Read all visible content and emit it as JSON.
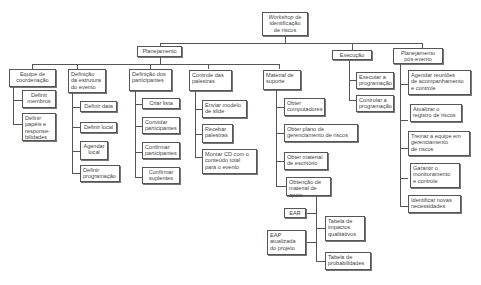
{
  "root": {
    "title_italic": "Workshop",
    "title_rest": " de\nidentificação\nde riscos"
  },
  "level1": [
    {
      "id": "planejamento",
      "label": "Planejamento"
    },
    {
      "id": "execucao",
      "label": "Execução"
    },
    {
      "id": "pos",
      "label": "Planejamento\npós-evento"
    }
  ],
  "planejamento": [
    {
      "label": "Equipe de\ncoordenação",
      "children": [
        "Definir\nmembros",
        "Definir\npapéis e\nresponse-\nbilidades"
      ]
    },
    {
      "label": "Definição\nda estrutura\ndo evento",
      "children": [
        "Definir data",
        "Definir local",
        "Agendar\nlocal",
        "Definir\nprogramação"
      ]
    },
    {
      "label": "Definição dos\nparticipantes",
      "children": [
        "Criar lista",
        "Convidar\nparticipantes",
        "Confirmar\nparticipantes",
        "Confirmar\nsuplentes"
      ]
    },
    {
      "label": "Controle das\npalestras",
      "children": [
        "Enviar modelo\nde slide",
        "Recebar\npalestras",
        "Montar CD com o\nconteúdo total\npara o evento"
      ]
    },
    {
      "label": "Material de\nsuporte",
      "children": [
        "Obter\ncomputadores",
        "Obter plano de\ngerenciamento de riscos",
        "Obter material\nde escritório",
        "Obtenção de\nmaterial de apoio"
      ]
    }
  ],
  "material_apoio": [
    "EAR",
    "EAP\natualizada\ndo projeto",
    "Tabela de\nimpactos\nqualitativos",
    "Tabela de\nprobabilidades"
  ],
  "execucao": [
    "Executar a\nprogramação",
    "Controlar a\nprogramação"
  ],
  "pos_evento": [
    "Agendar reuniões\nde acompanhamento\ne controle",
    "Atualizar o\nregistro de riscos",
    "Treinar a equipe em\ngerenciamento\nde riscos",
    "Garantir o\nmonitoramento\ne controle",
    "Identificar novas\nnecessidades"
  ]
}
